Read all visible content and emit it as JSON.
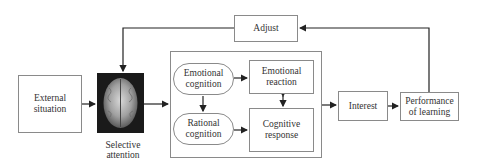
{
  "diagram": {
    "nodes": {
      "adjust": "Adjust",
      "external_situation": "External situation",
      "selective_attention": "Selective attention",
      "emotional_cognition": "Emotional cognition",
      "rational_cognition": "Rational cognition",
      "emotional_reaction": "Emotional reaction",
      "cognitive_response": "Cognitive response",
      "interest": "Interest",
      "performance_of_learning": "Performance of learning"
    },
    "edges": [
      {
        "from": "External situation",
        "to": "Selective attention"
      },
      {
        "from": "Selective attention",
        "to": "Cognition block"
      },
      {
        "from": "Emotional cognition",
        "to": "Emotional reaction"
      },
      {
        "from": "Emotional cognition",
        "to": "Rational cognition"
      },
      {
        "from": "Rational cognition",
        "to": "Cognitive response"
      },
      {
        "from": "Emotional reaction",
        "to": "Cognitive response",
        "bidirectional": true
      },
      {
        "from": "Cognition block",
        "to": "Interest"
      },
      {
        "from": "Interest",
        "to": "Performance of learning"
      },
      {
        "from": "Performance of learning",
        "to": "Adjust"
      },
      {
        "from": "Adjust",
        "to": "Selective attention"
      }
    ],
    "colors": {
      "line": "#222222",
      "border": "#8a8a8a",
      "brain_bg": "#1a1a1a"
    }
  }
}
